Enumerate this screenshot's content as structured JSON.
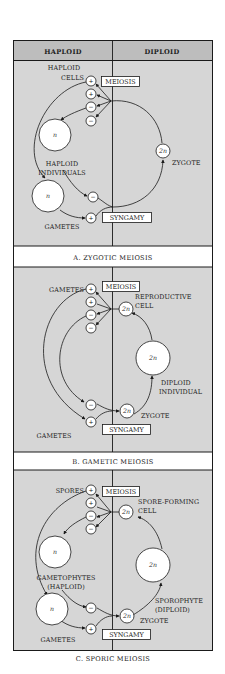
{
  "header": {
    "left": "HAPLOID",
    "right": "DIPLOID"
  },
  "colors": {
    "panel_bg": "#d6d6d6",
    "header_bg": "#bdbdbd",
    "caption_bg": "#ffffff",
    "line": "#1a1a1a",
    "node_fill": "#ffffff"
  },
  "symbols": {
    "plus": "+",
    "minus": "−",
    "haploid": "n",
    "diploid": "2n"
  },
  "panels": [
    {
      "caption": "A.  ZYGOTIC MEIOSIS",
      "meiosis": "MEIOSIS",
      "syngamy": "SYNGAMY",
      "labels": {
        "top_left_1": "HAPLOID",
        "top_left_2": "CELLS",
        "mid_left_1": "HAPLOID",
        "mid_left_2": "INDIVIDUALS",
        "bottom_left": "GAMETES",
        "zygote": "ZYGOTE"
      }
    },
    {
      "caption": "B.  GAMETIC MEIOSIS",
      "meiosis": "MEIOSIS",
      "syngamy": "SYNGAMY",
      "labels": {
        "top_left": "GAMETES",
        "repro_1": "REPRODUCTIVE",
        "repro_2": "CELL",
        "diploid_1": "DIPLOID",
        "diploid_2": "INDIVIDUAL",
        "zygote": "ZYGOTE",
        "bottom_left": "GAMETES"
      }
    },
    {
      "caption": "C.  SPORIC MEIOSIS",
      "meiosis": "MEIOSIS",
      "syngamy": "SYNGAMY",
      "labels": {
        "top_left": "SPORES",
        "spore_1": "SPORE-FORMING",
        "spore_2": "CELL",
        "gameto_1": "GAMETOPHYTES",
        "gameto_2": "(HAPLOID)",
        "sporo_1": "SPOROPHYTE",
        "sporo_2": "(DIPLOID)",
        "zygote": "ZYGOTE",
        "bottom_left": "GAMETES"
      }
    }
  ]
}
